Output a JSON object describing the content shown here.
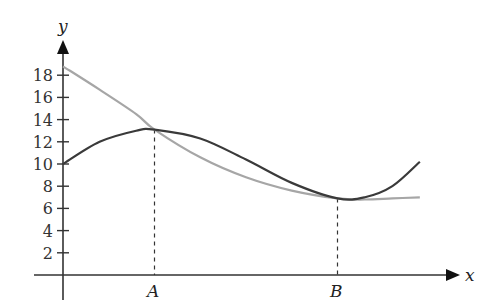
{
  "chart_data": {
    "type": "line",
    "title": "",
    "xlabel": "x",
    "ylabel": "y",
    "ylim": [
      0,
      19.5
    ],
    "grid": false,
    "legend": null,
    "yticks": [
      2,
      4,
      6,
      8,
      10,
      12,
      14,
      16,
      18
    ],
    "xtick_labels": [
      {
        "label": "A",
        "x": 1.0
      },
      {
        "label": "B",
        "x": 3.0
      }
    ],
    "series": [
      {
        "name": "dark-curve",
        "color": "#3a3a3a",
        "x": [
          0,
          0.4,
          0.8,
          1.0,
          1.5,
          2.0,
          2.5,
          3.0,
          3.3,
          3.6,
          3.9
        ],
        "y": [
          10,
          12.0,
          13.0,
          13.1,
          12.3,
          10.4,
          8.3,
          6.9,
          7.0,
          8.0,
          10.2
        ]
      },
      {
        "name": "gray-curve",
        "color": "#a6a6a6",
        "x": [
          0,
          0.4,
          0.8,
          1.0,
          1.5,
          2.0,
          2.5,
          3.0,
          3.3,
          3.6,
          3.9
        ],
        "y": [
          18.8,
          16.7,
          14.5,
          13.1,
          10.6,
          8.8,
          7.6,
          6.9,
          6.8,
          6.9,
          7.0
        ]
      }
    ],
    "annotations": [
      {
        "type": "dashed-vertical",
        "x": 1.0,
        "label": "A",
        "y_top": 13.1
      },
      {
        "type": "dashed-vertical",
        "x": 3.0,
        "label": "B",
        "y_top": 6.9
      }
    ]
  },
  "axes": {
    "x_label": "x",
    "y_label": "y",
    "y_tick_labels": [
      "2",
      "4",
      "6",
      "8",
      "10",
      "12",
      "14",
      "16",
      "18"
    ],
    "point_a_label": "A",
    "point_b_label": "B"
  }
}
